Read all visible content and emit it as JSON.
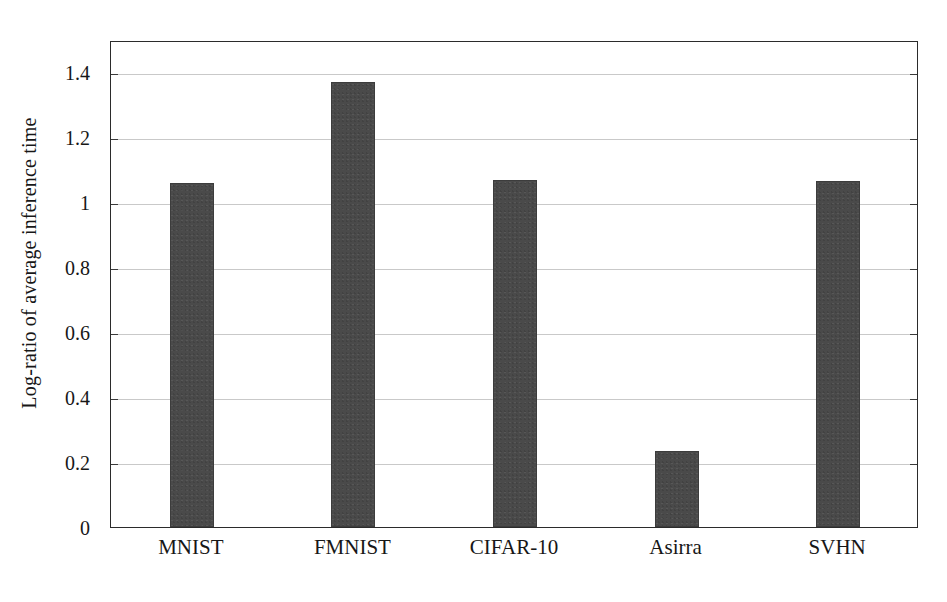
{
  "chart_data": {
    "type": "bar",
    "title": "",
    "xlabel": "",
    "ylabel": "Log-ratio of average inference time",
    "categories": [
      "MNIST",
      "FMNIST",
      "CIFAR-10",
      "Asirra",
      "SVHN"
    ],
    "values": [
      1.06,
      1.37,
      1.07,
      0.235,
      1.065
    ],
    "ylim": [
      0,
      1.5
    ],
    "yticks": [
      0,
      0.2,
      0.4,
      0.6,
      0.8,
      1,
      1.2,
      1.4
    ],
    "ytick_labels": [
      "0",
      "0.2",
      "0.4",
      "0.6",
      "0.8",
      "1",
      "1.2",
      "1.4"
    ],
    "grid": true,
    "legend": null,
    "bar_color": "#4a4a4a",
    "axis_color": "#2b2b2b",
    "grid_color": "#c9c9c9",
    "background_color": "#ffffff"
  }
}
